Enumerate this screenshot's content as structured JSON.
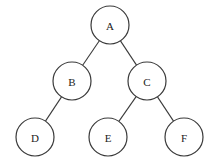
{
  "diagram": {
    "type": "binary-tree",
    "nodes": [
      {
        "id": "A",
        "label": "A",
        "x": 110,
        "y": 25,
        "r": 19
      },
      {
        "id": "B",
        "label": "B",
        "x": 72,
        "y": 81,
        "r": 19
      },
      {
        "id": "C",
        "label": "C",
        "x": 147,
        "y": 81,
        "r": 19
      },
      {
        "id": "D",
        "label": "D",
        "x": 35,
        "y": 137,
        "r": 19
      },
      {
        "id": "E",
        "label": "E",
        "x": 108,
        "y": 137,
        "r": 19
      },
      {
        "id": "F",
        "label": "F",
        "x": 184,
        "y": 137,
        "r": 19
      }
    ],
    "edges": [
      {
        "from": "A",
        "to": "B"
      },
      {
        "from": "A",
        "to": "C"
      },
      {
        "from": "B",
        "to": "D"
      },
      {
        "from": "C",
        "to": "E"
      },
      {
        "from": "C",
        "to": "F"
      }
    ],
    "colors": {
      "stroke": "#3a3a3a",
      "fill": "#ffffff",
      "text": "#222222"
    }
  }
}
